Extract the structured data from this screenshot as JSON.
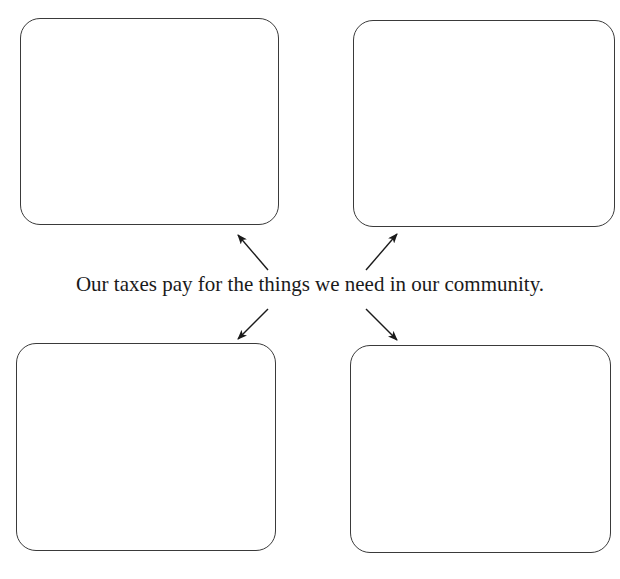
{
  "diagram": {
    "type": "web-graphic-organizer",
    "central_statement": "Our taxes pay for the things we need in our community.",
    "boxes": [
      {
        "position": "top-left",
        "content": ""
      },
      {
        "position": "top-right",
        "content": ""
      },
      {
        "position": "bottom-left",
        "content": ""
      },
      {
        "position": "bottom-right",
        "content": ""
      }
    ],
    "arrows": [
      {
        "from": "center",
        "to": "top-left"
      },
      {
        "from": "center",
        "to": "top-right"
      },
      {
        "from": "center",
        "to": "bottom-left"
      },
      {
        "from": "center",
        "to": "bottom-right"
      }
    ],
    "colors": {
      "stroke": "#3a3a3a",
      "text": "#1a1a1a",
      "background": "#ffffff"
    }
  }
}
